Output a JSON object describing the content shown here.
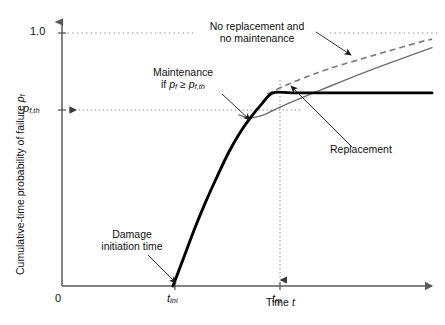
{
  "chart_data": {
    "type": "line",
    "title": "",
    "xlabel": "Time t",
    "ylabel": "Cumulative-time probability of failure p_f",
    "xlim": [
      0,
      1
    ],
    "ylim": [
      0,
      1.08
    ],
    "grid": false,
    "legend": "none",
    "axis_ticks": {
      "x": [
        {
          "label": "0",
          "value": 0
        },
        {
          "label": "t_ini",
          "value": 0.3
        },
        {
          "label": "t_rp",
          "value": 0.57
        }
      ],
      "y": [
        {
          "label": "1.0",
          "value": 1.0
        },
        {
          "label": "p_f,th",
          "value": 0.7
        }
      ]
    },
    "reference_lines": [
      {
        "name": "unity-line",
        "axis": "y",
        "value": 1.0,
        "style": "dotted"
      },
      {
        "name": "threshold-line",
        "axis": "y",
        "value": 0.7,
        "style": "dotted",
        "arrow": "left"
      },
      {
        "name": "replacement-time-line",
        "axis": "x",
        "value": 0.57,
        "style": "dotted",
        "arrow": "down"
      }
    ],
    "series": [
      {
        "name": "Replacement",
        "style": "solid-thick-black",
        "color": "#000000",
        "points": [
          [
            0.3,
            0.0
          ],
          [
            0.33,
            0.12
          ],
          [
            0.36,
            0.24
          ],
          [
            0.39,
            0.35
          ],
          [
            0.42,
            0.45
          ],
          [
            0.45,
            0.545
          ],
          [
            0.48,
            0.625
          ],
          [
            0.51,
            0.69
          ],
          [
            0.54,
            0.745
          ],
          [
            0.57,
            0.79
          ],
          [
            0.62,
            0.79
          ],
          [
            0.7,
            0.79
          ],
          [
            0.8,
            0.79
          ],
          [
            0.9,
            0.79
          ],
          [
            1.0,
            0.79
          ]
        ]
      },
      {
        "name": "Maintenance if p_f >= p_f,th",
        "style": "solid-thin-gray",
        "color": "#6e6e6e",
        "points": [
          [
            0.478,
            0.7
          ],
          [
            0.5,
            0.69
          ],
          [
            0.52,
            0.69
          ],
          [
            0.545,
            0.7
          ],
          [
            0.57,
            0.718
          ],
          [
            0.62,
            0.752
          ],
          [
            0.68,
            0.79
          ],
          [
            0.75,
            0.833
          ],
          [
            0.82,
            0.875
          ],
          [
            0.9,
            0.92
          ],
          [
            1.0,
            0.975
          ]
        ]
      },
      {
        "name": "No replacement and no maintenance",
        "style": "dashed-gray",
        "color": "#7a7a7a",
        "points": [
          [
            0.555,
            0.785
          ],
          [
            0.6,
            0.818
          ],
          [
            0.66,
            0.855
          ],
          [
            0.72,
            0.888
          ],
          [
            0.8,
            0.925
          ],
          [
            0.88,
            0.96
          ],
          [
            0.96,
            0.995
          ],
          [
            1.0,
            1.01
          ]
        ]
      }
    ],
    "annotations": [
      {
        "name": "no-replacement-annotation",
        "line1": "No replacement and",
        "line2": "no maintenance"
      },
      {
        "name": "maintenance-annotation",
        "line1": "Maintenance",
        "line2_prefix": "if ",
        "line2_pf": "p",
        "line2_pf_sub": "f",
        "line2_op": " ≥ ",
        "line2_pth": "p",
        "line2_pth_sub": "f,th"
      },
      {
        "name": "replacement-annotation",
        "text": "Replacement"
      },
      {
        "name": "damage-initiation-annotation",
        "line1": "Damage",
        "line2": "initiation time"
      }
    ]
  },
  "axis_text": {
    "y_label_prefix": "Cumulative-time probability of failure ",
    "y_label_symbol": "p",
    "y_label_symbol_sub": "f",
    "x_label_prefix": "Time ",
    "x_label_symbol": "t",
    "tick_one": "1.0",
    "tick_zero": "0",
    "tick_pth_symbol": "p",
    "tick_pth_sub": "f,th",
    "tick_tini_symbol": "t",
    "tick_tini_sub": "ini",
    "tick_trp_symbol": "t",
    "tick_trp_sub": "rp"
  },
  "colors": {
    "axis": "#5a5a5a",
    "curve_black": "#000000",
    "curve_gray": "#6e6e6e",
    "curve_dashed": "#7a7a7a",
    "dotted": "#8c8c8c",
    "text": "#111111"
  }
}
